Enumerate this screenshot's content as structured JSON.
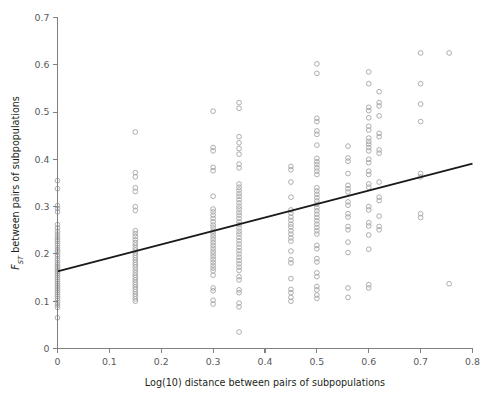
{
  "chart_data": {
    "type": "scatter",
    "title": "",
    "xlabel": "Log(10) distance between pairs of subpopulations",
    "ylabel": "F_ST between pairs of subpopulations",
    "ylabel_parts": {
      "symbol": "F",
      "subscript": "ST",
      "rest": " between pairs of subpopulations"
    },
    "xlim": [
      0,
      0.8
    ],
    "ylim": [
      0,
      0.7
    ],
    "xticks": [
      0,
      0.1,
      0.2,
      0.3,
      0.4,
      0.5,
      0.6,
      0.7,
      0.8
    ],
    "xticklabels": [
      "0",
      "0.1",
      "0.2",
      "0.3",
      "0.4",
      "0.5",
      "0.6",
      "0.7",
      "0.8"
    ],
    "yticks": [
      0,
      0.1,
      0.2,
      0.3,
      0.4,
      0.5,
      0.6,
      0.7
    ],
    "yticklabels": [
      "0",
      "0.1",
      "0.2",
      "0.3",
      "0.4",
      "0.5",
      "0.6",
      "0.7"
    ],
    "grid": false,
    "legend": false,
    "marker": "open-circle",
    "marker_color": "#a7a9ac",
    "marker_radius": 2.35,
    "trend_line": {
      "type": "linear-regression",
      "color": "#1a1a1a",
      "x_start": 0.0,
      "y_start": 0.163,
      "x_end": 0.8,
      "y_end": 0.391,
      "slope": 0.285,
      "intercept": 0.163
    },
    "series": [
      {
        "name": "pairwise FST vs log10 distance",
        "points": [
          [
            0.0,
            0.355
          ],
          [
            0.0,
            0.338
          ],
          [
            0.0,
            0.302
          ],
          [
            0.0,
            0.296
          ],
          [
            0.0,
            0.289
          ],
          [
            0.0,
            0.262
          ],
          [
            0.0,
            0.255
          ],
          [
            0.0,
            0.248
          ],
          [
            0.0,
            0.242
          ],
          [
            0.0,
            0.236
          ],
          [
            0.0,
            0.231
          ],
          [
            0.0,
            0.227
          ],
          [
            0.0,
            0.222
          ],
          [
            0.0,
            0.218
          ],
          [
            0.0,
            0.213
          ],
          [
            0.0,
            0.208
          ],
          [
            0.0,
            0.204
          ],
          [
            0.0,
            0.199
          ],
          [
            0.0,
            0.195
          ],
          [
            0.0,
            0.19
          ],
          [
            0.0,
            0.186
          ],
          [
            0.0,
            0.181
          ],
          [
            0.0,
            0.177
          ],
          [
            0.0,
            0.173
          ],
          [
            0.0,
            0.17
          ],
          [
            0.0,
            0.166
          ],
          [
            0.0,
            0.162
          ],
          [
            0.0,
            0.158
          ],
          [
            0.0,
            0.154
          ],
          [
            0.0,
            0.15
          ],
          [
            0.0,
            0.146
          ],
          [
            0.0,
            0.142
          ],
          [
            0.0,
            0.138
          ],
          [
            0.0,
            0.134
          ],
          [
            0.0,
            0.13
          ],
          [
            0.0,
            0.126
          ],
          [
            0.0,
            0.122
          ],
          [
            0.0,
            0.118
          ],
          [
            0.0,
            0.114
          ],
          [
            0.0,
            0.11
          ],
          [
            0.0,
            0.106
          ],
          [
            0.0,
            0.102
          ],
          [
            0.0,
            0.097
          ],
          [
            0.0,
            0.092
          ],
          [
            0.0,
            0.087
          ],
          [
            0.0,
            0.065
          ],
          [
            0.15,
            0.458
          ],
          [
            0.15,
            0.372
          ],
          [
            0.15,
            0.363
          ],
          [
            0.15,
            0.34
          ],
          [
            0.15,
            0.332
          ],
          [
            0.15,
            0.3
          ],
          [
            0.15,
            0.292
          ],
          [
            0.15,
            0.249
          ],
          [
            0.15,
            0.243
          ],
          [
            0.15,
            0.237
          ],
          [
            0.15,
            0.23
          ],
          [
            0.15,
            0.224
          ],
          [
            0.15,
            0.219
          ],
          [
            0.15,
            0.213
          ],
          [
            0.15,
            0.208
          ],
          [
            0.15,
            0.202
          ],
          [
            0.15,
            0.197
          ],
          [
            0.15,
            0.192
          ],
          [
            0.15,
            0.187
          ],
          [
            0.15,
            0.182
          ],
          [
            0.15,
            0.177
          ],
          [
            0.15,
            0.172
          ],
          [
            0.15,
            0.166
          ],
          [
            0.15,
            0.16
          ],
          [
            0.15,
            0.155
          ],
          [
            0.15,
            0.15
          ],
          [
            0.15,
            0.145
          ],
          [
            0.15,
            0.14
          ],
          [
            0.15,
            0.135
          ],
          [
            0.15,
            0.13
          ],
          [
            0.15,
            0.125
          ],
          [
            0.15,
            0.12
          ],
          [
            0.15,
            0.115
          ],
          [
            0.15,
            0.11
          ],
          [
            0.15,
            0.105
          ],
          [
            0.15,
            0.1
          ],
          [
            0.3,
            0.502
          ],
          [
            0.3,
            0.425
          ],
          [
            0.3,
            0.418
          ],
          [
            0.3,
            0.383
          ],
          [
            0.3,
            0.376
          ],
          [
            0.3,
            0.322
          ],
          [
            0.3,
            0.295
          ],
          [
            0.3,
            0.289
          ],
          [
            0.3,
            0.282
          ],
          [
            0.3,
            0.275
          ],
          [
            0.3,
            0.268
          ],
          [
            0.3,
            0.261
          ],
          [
            0.3,
            0.255
          ],
          [
            0.3,
            0.248
          ],
          [
            0.3,
            0.242
          ],
          [
            0.3,
            0.236
          ],
          [
            0.3,
            0.23
          ],
          [
            0.3,
            0.224
          ],
          [
            0.3,
            0.218
          ],
          [
            0.3,
            0.212
          ],
          [
            0.3,
            0.206
          ],
          [
            0.3,
            0.2
          ],
          [
            0.3,
            0.194
          ],
          [
            0.3,
            0.188
          ],
          [
            0.3,
            0.182
          ],
          [
            0.3,
            0.176
          ],
          [
            0.3,
            0.17
          ],
          [
            0.3,
            0.164
          ],
          [
            0.3,
            0.155
          ],
          [
            0.3,
            0.128
          ],
          [
            0.3,
            0.122
          ],
          [
            0.3,
            0.102
          ],
          [
            0.3,
            0.094
          ],
          [
            0.35,
            0.52
          ],
          [
            0.35,
            0.508
          ],
          [
            0.35,
            0.448
          ],
          [
            0.35,
            0.435
          ],
          [
            0.35,
            0.423
          ],
          [
            0.35,
            0.411
          ],
          [
            0.35,
            0.39
          ],
          [
            0.35,
            0.382
          ],
          [
            0.35,
            0.348
          ],
          [
            0.35,
            0.341
          ],
          [
            0.35,
            0.335
          ],
          [
            0.35,
            0.328
          ],
          [
            0.35,
            0.322
          ],
          [
            0.35,
            0.315
          ],
          [
            0.35,
            0.308
          ],
          [
            0.35,
            0.301
          ],
          [
            0.35,
            0.295
          ],
          [
            0.35,
            0.288
          ],
          [
            0.35,
            0.282
          ],
          [
            0.35,
            0.275
          ],
          [
            0.35,
            0.268
          ],
          [
            0.35,
            0.262
          ],
          [
            0.35,
            0.255
          ],
          [
            0.35,
            0.248
          ],
          [
            0.35,
            0.242
          ],
          [
            0.35,
            0.235
          ],
          [
            0.35,
            0.228
          ],
          [
            0.35,
            0.221
          ],
          [
            0.35,
            0.214
          ],
          [
            0.35,
            0.207
          ],
          [
            0.35,
            0.2
          ],
          [
            0.35,
            0.193
          ],
          [
            0.35,
            0.186
          ],
          [
            0.35,
            0.179
          ],
          [
            0.35,
            0.172
          ],
          [
            0.35,
            0.165
          ],
          [
            0.35,
            0.152
          ],
          [
            0.35,
            0.145
          ],
          [
            0.35,
            0.124
          ],
          [
            0.35,
            0.118
          ],
          [
            0.35,
            0.096
          ],
          [
            0.35,
            0.088
          ],
          [
            0.35,
            0.035
          ],
          [
            0.45,
            0.385
          ],
          [
            0.45,
            0.378
          ],
          [
            0.45,
            0.352
          ],
          [
            0.45,
            0.32
          ],
          [
            0.45,
            0.293
          ],
          [
            0.45,
            0.286
          ],
          [
            0.45,
            0.278
          ],
          [
            0.45,
            0.271
          ],
          [
            0.45,
            0.263
          ],
          [
            0.45,
            0.257
          ],
          [
            0.45,
            0.249
          ],
          [
            0.45,
            0.242
          ],
          [
            0.45,
            0.234
          ],
          [
            0.45,
            0.227
          ],
          [
            0.45,
            0.206
          ],
          [
            0.45,
            0.188
          ],
          [
            0.45,
            0.181
          ],
          [
            0.45,
            0.148
          ],
          [
            0.45,
            0.125
          ],
          [
            0.45,
            0.118
          ],
          [
            0.45,
            0.108
          ],
          [
            0.45,
            0.1
          ],
          [
            0.5,
            0.602
          ],
          [
            0.5,
            0.582
          ],
          [
            0.5,
            0.487
          ],
          [
            0.5,
            0.48
          ],
          [
            0.5,
            0.46
          ],
          [
            0.5,
            0.453
          ],
          [
            0.5,
            0.43
          ],
          [
            0.5,
            0.402
          ],
          [
            0.5,
            0.395
          ],
          [
            0.5,
            0.389
          ],
          [
            0.5,
            0.382
          ],
          [
            0.5,
            0.375
          ],
          [
            0.5,
            0.368
          ],
          [
            0.5,
            0.34
          ],
          [
            0.5,
            0.333
          ],
          [
            0.5,
            0.326
          ],
          [
            0.5,
            0.319
          ],
          [
            0.5,
            0.312
          ],
          [
            0.5,
            0.305
          ],
          [
            0.5,
            0.298
          ],
          [
            0.5,
            0.291
          ],
          [
            0.5,
            0.284
          ],
          [
            0.5,
            0.277
          ],
          [
            0.5,
            0.27
          ],
          [
            0.5,
            0.263
          ],
          [
            0.5,
            0.256
          ],
          [
            0.5,
            0.249
          ],
          [
            0.5,
            0.242
          ],
          [
            0.5,
            0.218
          ],
          [
            0.5,
            0.211
          ],
          [
            0.5,
            0.19
          ],
          [
            0.5,
            0.183
          ],
          [
            0.5,
            0.16
          ],
          [
            0.5,
            0.152
          ],
          [
            0.5,
            0.131
          ],
          [
            0.5,
            0.124
          ],
          [
            0.5,
            0.113
          ],
          [
            0.5,
            0.106
          ],
          [
            0.56,
            0.428
          ],
          [
            0.56,
            0.403
          ],
          [
            0.56,
            0.396
          ],
          [
            0.56,
            0.37
          ],
          [
            0.56,
            0.345
          ],
          [
            0.56,
            0.338
          ],
          [
            0.56,
            0.331
          ],
          [
            0.56,
            0.31
          ],
          [
            0.56,
            0.303
          ],
          [
            0.56,
            0.285
          ],
          [
            0.56,
            0.278
          ],
          [
            0.56,
            0.258
          ],
          [
            0.56,
            0.251
          ],
          [
            0.56,
            0.225
          ],
          [
            0.56,
            0.203
          ],
          [
            0.56,
            0.128
          ],
          [
            0.56,
            0.108
          ],
          [
            0.6,
            0.585
          ],
          [
            0.6,
            0.56
          ],
          [
            0.6,
            0.51
          ],
          [
            0.6,
            0.503
          ],
          [
            0.6,
            0.488
          ],
          [
            0.6,
            0.47
          ],
          [
            0.6,
            0.462
          ],
          [
            0.6,
            0.445
          ],
          [
            0.6,
            0.438
          ],
          [
            0.6,
            0.432
          ],
          [
            0.6,
            0.425
          ],
          [
            0.6,
            0.418
          ],
          [
            0.6,
            0.4
          ],
          [
            0.6,
            0.393
          ],
          [
            0.6,
            0.375
          ],
          [
            0.6,
            0.368
          ],
          [
            0.6,
            0.348
          ],
          [
            0.6,
            0.341
          ],
          [
            0.6,
            0.3
          ],
          [
            0.6,
            0.293
          ],
          [
            0.6,
            0.266
          ],
          [
            0.6,
            0.259
          ],
          [
            0.6,
            0.24
          ],
          [
            0.6,
            0.21
          ],
          [
            0.6,
            0.135
          ],
          [
            0.6,
            0.128
          ],
          [
            0.62,
            0.543
          ],
          [
            0.62,
            0.52
          ],
          [
            0.62,
            0.513
          ],
          [
            0.62,
            0.492
          ],
          [
            0.62,
            0.455
          ],
          [
            0.62,
            0.448
          ],
          [
            0.62,
            0.42
          ],
          [
            0.62,
            0.413
          ],
          [
            0.62,
            0.352
          ],
          [
            0.62,
            0.32
          ],
          [
            0.62,
            0.313
          ],
          [
            0.62,
            0.28
          ],
          [
            0.62,
            0.258
          ],
          [
            0.62,
            0.251
          ],
          [
            0.7,
            0.625
          ],
          [
            0.7,
            0.56
          ],
          [
            0.7,
            0.517
          ],
          [
            0.7,
            0.48
          ],
          [
            0.7,
            0.37
          ],
          [
            0.7,
            0.363
          ],
          [
            0.7,
            0.285
          ],
          [
            0.7,
            0.277
          ],
          [
            0.755,
            0.625
          ],
          [
            0.755,
            0.137
          ]
        ]
      }
    ]
  }
}
